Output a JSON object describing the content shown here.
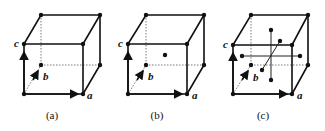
{
  "figure": {
    "panels": [
      {
        "id": "a",
        "caption": "(a)",
        "lattice": "primitive",
        "axes": {
          "a": "a",
          "b": "b",
          "c": "c"
        }
      },
      {
        "id": "b",
        "caption": "(b)",
        "lattice": "body-centered",
        "axes": {
          "a": "a",
          "b": "b",
          "c": "c"
        }
      },
      {
        "id": "c",
        "caption": "(c)",
        "lattice": "face-centered",
        "axes": {
          "a": "a",
          "b": "b",
          "c": "c"
        }
      }
    ]
  }
}
